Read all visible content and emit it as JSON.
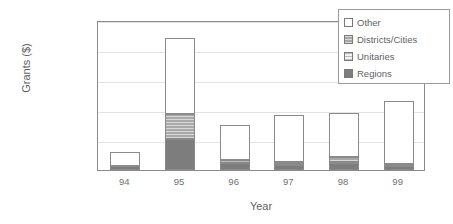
{
  "chart_data": {
    "type": "bar",
    "stacked": true,
    "title": "",
    "xlabel": "Year",
    "ylabel": "Grants ($)",
    "categories": [
      "94",
      "95",
      "96",
      "97",
      "98",
      "99"
    ],
    "ylim": [
      0,
      10000000
    ],
    "yticks": [
      0,
      2000000,
      4000000,
      6000000,
      8000000,
      10000000
    ],
    "ytick_labels": [
      "0",
      "2,000,000",
      "4,000,000",
      "6,000,000",
      "8,000,000",
      "10,000,000"
    ],
    "grid": true,
    "legend_position": "top-right",
    "series": [
      {
        "name": "Regions",
        "values": [
          300000,
          2100000,
          450000,
          350000,
          500000,
          250000
        ]
      },
      {
        "name": "Unitaries",
        "values": [
          0,
          0,
          200000,
          50000,
          50000,
          100000
        ]
      },
      {
        "name": "Districts/Cities",
        "values": [
          0,
          1650000,
          50000,
          150000,
          350000,
          50000
        ]
      },
      {
        "name": "Other",
        "values": [
          900000,
          5050000,
          2300000,
          3150000,
          2900000,
          4200000
        ]
      }
    ],
    "totals": [
      1200000,
      8800000,
      3000000,
      3700000,
      3800000,
      4600000
    ],
    "colors": {
      "Regions": "#7d7d7d",
      "Unitaries": "#f2f2f2",
      "Districts/Cities": "#a8a8a8",
      "Other": "#ffffff",
      "axis": "#8a8a8a",
      "grid": "#e3e3e3",
      "text": "#6f6f6f"
    }
  },
  "legend": {
    "items": [
      {
        "label": "Other",
        "swatch": "other-swatch-icon"
      },
      {
        "label": "Districts/Cities",
        "swatch": "districts-cities-swatch-icon"
      },
      {
        "label": "Unitaries",
        "swatch": "unitaries-swatch-icon"
      },
      {
        "label": "Regions",
        "swatch": "regions-swatch-icon"
      }
    ]
  }
}
